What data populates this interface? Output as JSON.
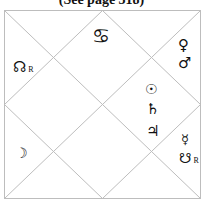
{
  "caption": "(See page 318)",
  "chart": {
    "style": "North Indian diamond horoscope",
    "line_color": "#bdbdbd",
    "houses": [
      {
        "position": "top-center",
        "glyphs": [
          {
            "symbol": "♋",
            "name": "Cancer"
          }
        ]
      },
      {
        "position": "left-upper",
        "glyphs": [
          {
            "symbol": "☊",
            "name": "Rahu",
            "retro": "R"
          }
        ]
      },
      {
        "position": "right-upper",
        "glyphs": [
          {
            "symbol": "♀",
            "name": "Venus"
          },
          {
            "symbol": "♂",
            "name": "Mars"
          }
        ]
      },
      {
        "position": "center-right",
        "glyphs": [
          {
            "symbol": "☉",
            "name": "Sun"
          },
          {
            "symbol": "♄",
            "name": "Saturn"
          },
          {
            "symbol": "♃",
            "name": "Jupiter"
          }
        ]
      },
      {
        "position": "right-lower",
        "glyphs": [
          {
            "symbol": "☿",
            "name": "Mercury"
          },
          {
            "symbol": "☋",
            "name": "Ketu",
            "retro": "R"
          }
        ]
      },
      {
        "position": "left-lower",
        "glyphs": [
          {
            "symbol": "☽",
            "name": "Moon"
          }
        ]
      }
    ]
  }
}
